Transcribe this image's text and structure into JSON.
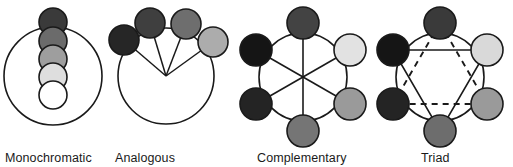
{
  "figure": {
    "background_color": "#ffffff",
    "stroke_color": "#1a1a1a",
    "label_color": "#1a1a1a"
  },
  "schemes": [
    {
      "id": "monochromatic",
      "label": "Monochromatic",
      "label_x": 5,
      "label_y": 162,
      "wheel": {
        "cx": 53,
        "cy": 76,
        "r": 49,
        "stroke": "#1a1a1a",
        "stroke_width": 1.6,
        "fill": "#ffffff"
      },
      "connector_type": "none",
      "swatches": [
        {
          "name": "swatch-1",
          "cx": 53,
          "cy": 22,
          "r": 14,
          "color": "#3a3a3a"
        },
        {
          "name": "swatch-2",
          "cx": 53,
          "cy": 41,
          "r": 14,
          "color": "#6b6b6b"
        },
        {
          "name": "swatch-3",
          "cx": 53,
          "cy": 59,
          "r": 14,
          "color": "#9e9e9e"
        },
        {
          "name": "swatch-4",
          "cx": 53,
          "cy": 77,
          "r": 14,
          "color": "#dedede"
        },
        {
          "name": "swatch-5",
          "cx": 53,
          "cy": 95,
          "r": 14,
          "color": "#ffffff"
        }
      ]
    },
    {
      "id": "analogous",
      "label": "Analogous",
      "label_x": 115,
      "label_y": 162,
      "wheel": {
        "cx": 166,
        "cy": 76,
        "r": 48,
        "stroke": "#1a1a1a",
        "stroke_width": 1.6,
        "fill": "#ffffff"
      },
      "connector_type": "radii",
      "swatches": [
        {
          "name": "swatch-1",
          "cx": 124,
          "cy": 40,
          "r": 15,
          "color": "#262626"
        },
        {
          "name": "swatch-2",
          "cx": 150,
          "cy": 23,
          "r": 15,
          "color": "#3f3f3f"
        },
        {
          "name": "swatch-3",
          "cx": 186,
          "cy": 24,
          "r": 15,
          "color": "#6e6e6e"
        },
        {
          "name": "swatch-4",
          "cx": 213,
          "cy": 42,
          "r": 15,
          "color": "#acacac"
        }
      ]
    },
    {
      "id": "complementary",
      "label": "Complementary",
      "label_x": 257,
      "label_y": 162,
      "wheel": {
        "cx": 303,
        "cy": 77,
        "r": 44,
        "stroke": "#1a1a1a",
        "stroke_width": 1.6,
        "fill": "#ffffff"
      },
      "connector_type": "diameters",
      "swatches": [
        {
          "name": "swatch-top",
          "cx": 303,
          "cy": 23,
          "r": 16,
          "color": "#434343"
        },
        {
          "name": "swatch-upper-right",
          "cx": 350,
          "cy": 50,
          "r": 16,
          "color": "#e2e2e2"
        },
        {
          "name": "swatch-lower-right",
          "cx": 350,
          "cy": 104,
          "r": 16,
          "color": "#9a9a9a"
        },
        {
          "name": "swatch-bottom",
          "cx": 303,
          "cy": 131,
          "r": 16,
          "color": "#757575"
        },
        {
          "name": "swatch-lower-left",
          "cx": 256,
          "cy": 104,
          "r": 16,
          "color": "#242424"
        },
        {
          "name": "swatch-upper-left",
          "cx": 256,
          "cy": 50,
          "r": 16,
          "color": "#151515"
        }
      ]
    },
    {
      "id": "triad",
      "label": "Triad",
      "label_x": 421,
      "label_y": 162,
      "wheel": {
        "cx": 440,
        "cy": 77,
        "r": 44,
        "stroke": "#1a1a1a",
        "stroke_width": 1.6,
        "fill": "#ffffff"
      },
      "connector_type": "star",
      "swatches": [
        {
          "name": "swatch-top",
          "cx": 440,
          "cy": 23,
          "r": 16,
          "color": "#3a3a3a"
        },
        {
          "name": "swatch-upper-right",
          "cx": 487,
          "cy": 50,
          "r": 16,
          "color": "#d9d9d9"
        },
        {
          "name": "swatch-lower-right",
          "cx": 487,
          "cy": 104,
          "r": 16,
          "color": "#9a9a9a"
        },
        {
          "name": "swatch-bottom",
          "cx": 440,
          "cy": 131,
          "r": 16,
          "color": "#6d6d6d"
        },
        {
          "name": "swatch-lower-left",
          "cx": 393,
          "cy": 104,
          "r": 16,
          "color": "#242424"
        },
        {
          "name": "swatch-upper-left",
          "cx": 393,
          "cy": 50,
          "r": 16,
          "color": "#151515"
        }
      ],
      "solid_triangle": [
        [
          393,
          50
        ],
        [
          487,
          50
        ],
        [
          440,
          131
        ]
      ],
      "dashed_triangle": [
        [
          440,
          23
        ],
        [
          487,
          104
        ],
        [
          393,
          104
        ]
      ]
    }
  ]
}
